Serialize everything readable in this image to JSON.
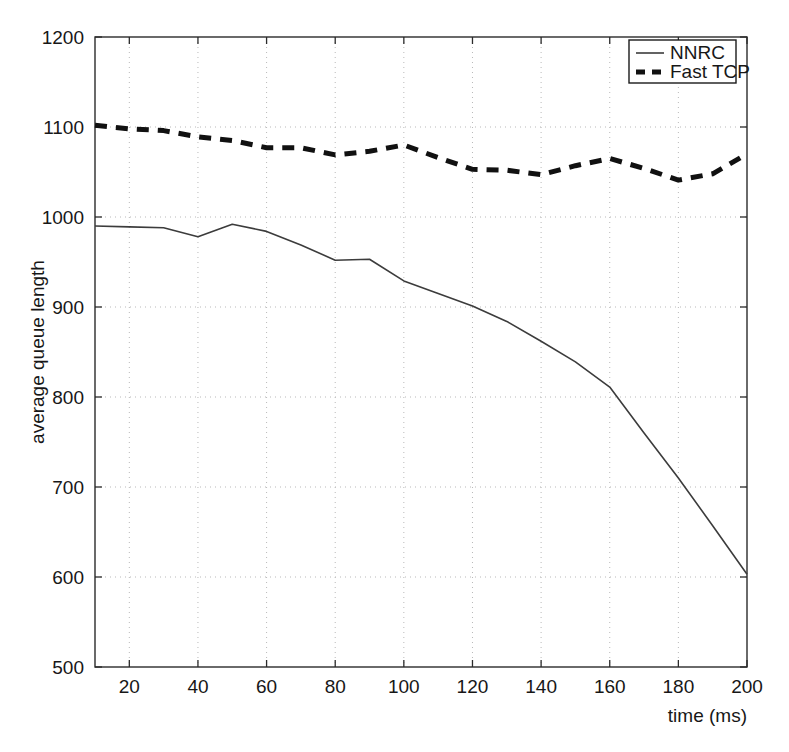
{
  "chart_data": {
    "type": "line",
    "title": "",
    "xlabel": "time (ms)",
    "ylabel": "average queue length",
    "xlim": [
      10,
      200
    ],
    "ylim": [
      500,
      1200
    ],
    "xticks": [
      20,
      40,
      60,
      80,
      100,
      120,
      140,
      160,
      180,
      200
    ],
    "xtick_labels": [
      "20",
      "40",
      "60",
      "80",
      "100",
      "120",
      "140",
      "160",
      "180",
      "200"
    ],
    "yticks": [
      500,
      600,
      700,
      800,
      900,
      1000,
      1100,
      1200
    ],
    "ytick_labels": [
      "500",
      "600",
      "700",
      "800",
      "900",
      "1000",
      "1100",
      "1200"
    ],
    "grid": true,
    "grid_style": "dotted",
    "legend_position": "top-right",
    "series": [
      {
        "name": "NNRC",
        "style": "solid",
        "color": "#3c3c3c",
        "width": 1.6,
        "x": [
          10,
          20,
          30,
          40,
          50,
          60,
          70,
          80,
          90,
          100,
          110,
          120,
          130,
          140,
          150,
          160,
          170,
          180,
          190,
          200
        ],
        "values": [
          990,
          989,
          988,
          978,
          992,
          984,
          969,
          952,
          953,
          929,
          915,
          901,
          884,
          862,
          839,
          811,
          760,
          710,
          657,
          603
        ]
      },
      {
        "name": "Fast TCP",
        "style": "dashed",
        "color": "#111111",
        "width": 5.0,
        "x": [
          10,
          20,
          30,
          40,
          50,
          60,
          70,
          80,
          90,
          100,
          110,
          120,
          130,
          140,
          150,
          160,
          170,
          180,
          190,
          200
        ],
        "values": [
          1102,
          1098,
          1096,
          1089,
          1085,
          1077,
          1077,
          1069,
          1073,
          1080,
          1066,
          1053,
          1052,
          1047,
          1057,
          1065,
          1054,
          1041,
          1048,
          1070
        ]
      }
    ]
  },
  "legend": {
    "entries": [
      {
        "label": "NNRC",
        "marker": "solid-line"
      },
      {
        "label": "Fast TCP",
        "marker": "dashed-line"
      }
    ]
  },
  "axes": {
    "x_title": "time (ms)",
    "y_title": "average queue length"
  }
}
